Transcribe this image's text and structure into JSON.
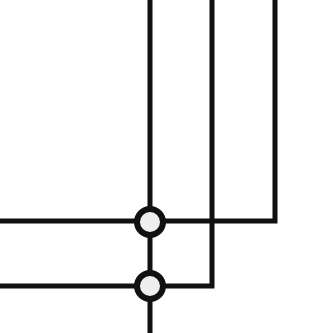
{
  "diagram": {
    "type": "wire-crossing-junction",
    "canvas": {
      "width": 315,
      "height": 333
    },
    "colors": {
      "background": "#ffffff",
      "stroke": "#111111",
      "node_fill": "#eeeeee"
    },
    "stroke_width": 5,
    "wires": [
      {
        "id": "vertical-left",
        "points": [
          [
            150,
            0
          ],
          [
            150,
            333
          ]
        ]
      },
      {
        "id": "vertical-middle-to-lower-horizontal",
        "points": [
          [
            212,
            0
          ],
          [
            212,
            286
          ],
          [
            0,
            286
          ]
        ]
      },
      {
        "id": "vertical-right-to-upper-horizontal",
        "points": [
          [
            275,
            0
          ],
          [
            275,
            221
          ],
          [
            0,
            221
          ]
        ]
      }
    ],
    "nodes": [
      {
        "id": "junction-upper",
        "cx": 150,
        "cy": 222,
        "r": 13
      },
      {
        "id": "junction-lower",
        "cx": 150,
        "cy": 286,
        "r": 13
      }
    ]
  }
}
